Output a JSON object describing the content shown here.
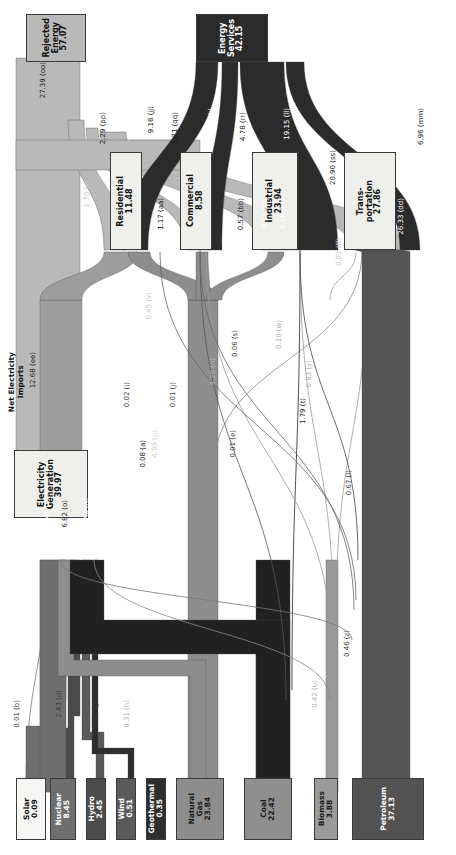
{
  "chart_data": {
    "type": "sankey",
    "orientation": "rotated-90",
    "units": "Quads",
    "nodes": [
      {
        "id": "solar",
        "label": "Solar",
        "value": "0.09",
        "color": "#f6f6f4",
        "text": "#111111"
      },
      {
        "id": "nuclear",
        "label": "Nuclear",
        "value": "8.45",
        "color": "#6e6e6e",
        "text": "#ffffff"
      },
      {
        "id": "hydro",
        "label": "Hydro",
        "value": "2.45",
        "color": "#4b4b4b",
        "text": "#ffffff"
      },
      {
        "id": "wind",
        "label": "Wind",
        "value": "0.51",
        "color": "#5a5a5a",
        "text": "#ffffff"
      },
      {
        "id": "geothermal",
        "label": "Geothermal",
        "value": "0.35",
        "color": "#2e2e2e",
        "text": "#ffffff"
      },
      {
        "id": "natural_gas",
        "label": "Natural\nGas",
        "value": "23.84",
        "color": "#8d8d8d",
        "text": "#1a1a1a"
      },
      {
        "id": "coal",
        "label": "Coal",
        "value": "22.42",
        "color": "#8f8f8f",
        "text": "#1a1a1a"
      },
      {
        "id": "biomass",
        "label": "Biomass",
        "value": "3.88",
        "color": "#9a9a9a",
        "text": "#1a1a1a"
      },
      {
        "id": "petroleum",
        "label": "Petroleum",
        "value": "37.13",
        "color": "#535353",
        "text": "#ffffff"
      },
      {
        "id": "electricity_generation",
        "label": "Electricity\nGeneration",
        "value": "39.97",
        "color": "#efefeb",
        "text": "#111111"
      },
      {
        "id": "residential",
        "label": "Residential",
        "value": "11.48",
        "color": "#efefeb",
        "text": "#111111"
      },
      {
        "id": "commercial",
        "label": "Commercial",
        "value": "8.58",
        "color": "#efefeb",
        "text": "#111111"
      },
      {
        "id": "industrial",
        "label": "Industrial",
        "value": "23.94",
        "color": "#efefeb",
        "text": "#111111"
      },
      {
        "id": "transportation",
        "label": "Trans-\nportation",
        "value": "27.86",
        "color": "#efefeb",
        "text": "#111111"
      },
      {
        "id": "rejected_energy",
        "label": "Rejected\nEnergy",
        "value": "57.07",
        "color": "#b9b9b9",
        "text": "#111111"
      },
      {
        "id": "energy_services",
        "label": "Energy\nServices",
        "value": "42.15",
        "color": "#2b2b2b",
        "text": "#ffffff"
      }
    ],
    "standalone_labels": [
      {
        "id": "net_electricity_imports",
        "text": "Net Electricity\nImports"
      }
    ],
    "flows": [
      {
        "key": "b",
        "value": "0.01",
        "label": "0.01 (b)",
        "from": "solar",
        "to": "electricity_generation"
      },
      {
        "key": "c",
        "value": "8.45",
        "label": "8.45 (c)",
        "from": "nuclear",
        "to": "electricity_generation"
      },
      {
        "key": "d",
        "value": "2.43",
        "label": "2.43 (d)",
        "from": "hydro",
        "to": "electricity_generation"
      },
      {
        "key": "e",
        "value": "0.01",
        "label": "0.01 (e)",
        "from": "hydro",
        "to": "industrial"
      },
      {
        "key": "g",
        "value": "0.51",
        "label": "0.51 (g)",
        "from": "wind",
        "to": "electricity_generation"
      },
      {
        "key": "h",
        "value": "0.31",
        "label": "0.31 (h)",
        "from": "geothermal",
        "to": "electricity_generation"
      },
      {
        "key": "i",
        "value": "0.02",
        "label": "0.02 (i)",
        "from": "geothermal",
        "to": "residential"
      },
      {
        "key": "j",
        "value": "0.01",
        "label": "0.01 (j)",
        "from": "geothermal",
        "to": "commercial"
      },
      {
        "key": "l",
        "value": "0.67",
        "label": "0.67 (l)",
        "from": "natural_gas",
        "to": "transportation"
      },
      {
        "key": "m",
        "value": "8.14",
        "label": "8.14 (m)",
        "from": "natural_gas",
        "to": "industrial"
      },
      {
        "key": "n",
        "value": "3.20",
        "label": "3.20 (n)",
        "from": "natural_gas",
        "to": "commercial"
      },
      {
        "key": "o",
        "value": "6.82",
        "label": "6.82 (o)",
        "from": "natural_gas",
        "to": "electricity_generation"
      },
      {
        "key": "p",
        "value": "4.99",
        "label": "4.99 (p)",
        "from": "natural_gas",
        "to": "residential"
      },
      {
        "key": "q",
        "value": "20.54",
        "label": "20.54 (q)",
        "from": "coal",
        "to": "electricity_generation"
      },
      {
        "key": "s",
        "value": "0.06",
        "label": "0.06 (s)",
        "from": "coal",
        "to": "commercial"
      },
      {
        "key": "t",
        "value": "1.79",
        "label": "1.79 (t)",
        "from": "coal",
        "to": "industrial"
      },
      {
        "key": "u",
        "value": "0.42",
        "label": "0.42 (u)",
        "from": "biomass",
        "to": "electricity_generation"
      },
      {
        "key": "w",
        "value": "0.10",
        "label": "0.10 (w)",
        "from": "biomass",
        "to": "commercial"
      },
      {
        "key": "y",
        "value": "0.83",
        "label": "0.83 (y)",
        "from": "biomass",
        "to": "industrial"
      },
      {
        "key": "z",
        "value": "0.46",
        "label": "0.46 (z)",
        "from": "biomass",
        "to": "transportation"
      },
      {
        "key": "a",
        "value": "0.08",
        "label": "0.08 (a)",
        "from": "petroleum",
        "to": "electricity_generation"
      },
      {
        "key": "aa",
        "value": "1.17",
        "label": "1.17 (aa)",
        "from": "petroleum",
        "to": "residential"
      },
      {
        "key": "bb",
        "value": "0.57",
        "label": "0.57 (bb)",
        "from": "petroleum",
        "to": "commercial"
      },
      {
        "key": "cc",
        "value": "8.58",
        "label": "8.58 (cc)",
        "from": "petroleum",
        "to": "industrial"
      },
      {
        "key": "dd",
        "value": "26.33",
        "label": "26.33 (dd)",
        "from": "petroleum",
        "to": "transportation"
      },
      {
        "key": "ee",
        "value": "12.68",
        "label": "12.68 (ee)",
        "from": "electricity_generation",
        "to": "residential_commercial_industrial"
      },
      {
        "key": "ff",
        "value": "0.02",
        "label": "0.02 (ff)",
        "from": "electricity_generation",
        "to": "transportation"
      },
      {
        "key": "oo",
        "value": "27.39",
        "label": "27.39 (oo)",
        "from": "electricity_generation",
        "to": "rejected_energy"
      },
      {
        "key": "pp",
        "value": "2.29",
        "label": "2.29 (pp)",
        "from": "residential",
        "to": "rejected_energy"
      },
      {
        "key": "jj",
        "value": "9.18",
        "label": "9.18 (jj)",
        "from": "residential",
        "to": "energy_services"
      },
      {
        "key": "qq",
        "value": "1.71",
        "label": "1.71 (qq)",
        "from": "commercial",
        "to": "rejected_energy"
      },
      {
        "key": "kk",
        "value": "6.86",
        "label": "6.86 (kk)",
        "from": "commercial",
        "to": "energy_services"
      },
      {
        "key": "rr",
        "value": "4.78",
        "label": "4.78 (rr)",
        "from": "industrial",
        "to": "rejected_energy"
      },
      {
        "key": "ll",
        "value": "19.15",
        "label": "19.15 (ll)",
        "from": "industrial",
        "to": "energy_services"
      },
      {
        "key": "ss",
        "value": "20.90",
        "label": "20.90 (ss)",
        "from": "transportation",
        "to": "rejected_energy"
      },
      {
        "key": "mm",
        "value": "6.96",
        "label": "6.96 (mm)",
        "from": "transportation",
        "to": "energy_services"
      },
      {
        "key": "v",
        "value": "0.45",
        "label": "0.45 (v)",
        "from": "biomass",
        "to": "residential"
      },
      {
        "key": "x",
        "value": "1.70",
        "label": "1.70 (x)",
        "from": "electricity_generation",
        "to": "commercial"
      }
    ]
  },
  "palette": {
    "rejected": "#b9b9b9",
    "services": "#2b2b2b",
    "electric": "#9d9d9d",
    "petroleum": "#555555",
    "coal": "#212121",
    "gas": "#8d8d8d",
    "biomass": "#9a9a9a",
    "nuclear": "#6e6e6e",
    "hydro": "#4b4b4b",
    "wind": "#5a5a5a",
    "geothermal": "#2e2e2e",
    "solar": "#f2f2f0",
    "sector_box": "#efefeb",
    "stroke": "#3a3a3a"
  }
}
